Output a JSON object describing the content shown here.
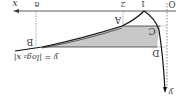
{
  "figure": {
    "rotation_deg": 180,
    "function_label": "y = |log₂ x|",
    "axis_labels": {
      "x": "x",
      "y": "y",
      "origin": "O"
    },
    "x_ticks": [
      "1",
      "2",
      "8"
    ],
    "points": [
      "A",
      "B",
      "C",
      "D"
    ],
    "shaded_color": "#c8c8c8",
    "line_color": "#222222"
  }
}
